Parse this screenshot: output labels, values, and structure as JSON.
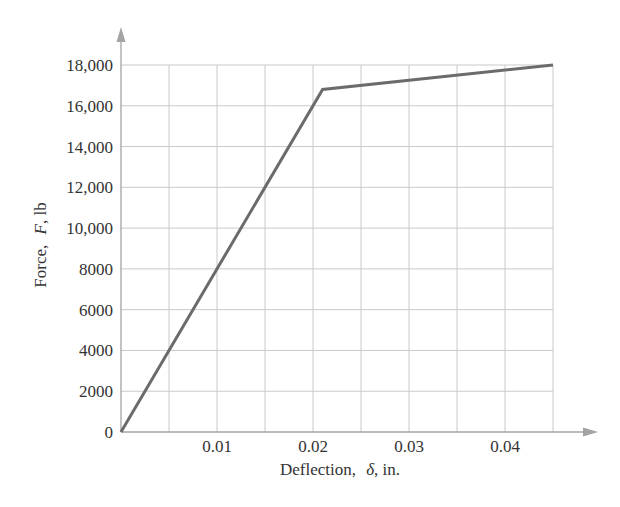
{
  "chart_data": {
    "type": "line",
    "title": "",
    "xlabel": "Deflection, δ, in.",
    "xlabel_parts": {
      "name": "Deflection,",
      "symbol": "δ",
      "unit": ", in."
    },
    "ylabel": "Force, F, lb",
    "ylabel_parts": {
      "name": "Force,",
      "symbol": "F",
      "unit": ", lb"
    },
    "xlim": [
      0,
      0.045
    ],
    "ylim": [
      0,
      18000
    ],
    "x_ticks": [
      0.01,
      0.02,
      0.03,
      0.04
    ],
    "x_tick_labels": [
      "0.01",
      "0.02",
      "0.03",
      "0.04"
    ],
    "x_grid_step": 0.005,
    "y_ticks": [
      0,
      2000,
      4000,
      6000,
      8000,
      10000,
      12000,
      14000,
      16000,
      18000
    ],
    "y_tick_labels": [
      "0",
      "2000",
      "4000",
      "6000",
      "8000",
      "10,000",
      "12,000",
      "14,000",
      "16,000",
      "18,000"
    ],
    "grid": true,
    "legend": null,
    "series": [
      {
        "name": "Force-deflection curve",
        "color": "#6b6b6b",
        "x": [
          0,
          0.021,
          0.045
        ],
        "y": [
          0,
          16800,
          18000
        ]
      }
    ]
  },
  "colors": {
    "grid": "#c9c9c9",
    "axis": "#a3a3a3",
    "text": "#333333",
    "curve": "#6b6b6b"
  }
}
